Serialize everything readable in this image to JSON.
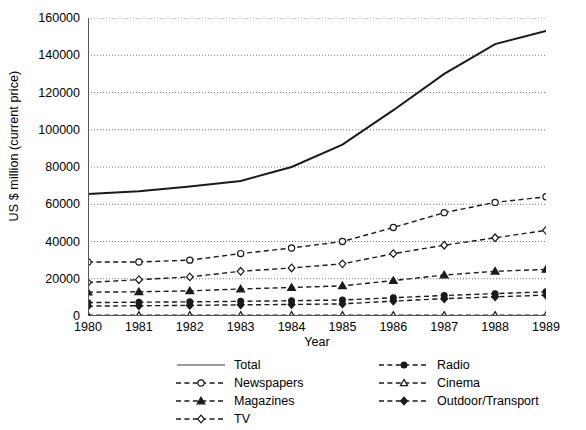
{
  "chart_data": {
    "type": "line",
    "title": "",
    "xlabel": "Year",
    "ylabel": "US $ million (current price)",
    "x": [
      1980,
      1981,
      1982,
      1983,
      1984,
      1985,
      1986,
      1987,
      1988,
      1989
    ],
    "xtick_labels": [
      "1980",
      "1981",
      "1982",
      "1983",
      "1984",
      "1985",
      "1986",
      "1987",
      "1988",
      "1989"
    ],
    "ytick_labels": [
      "0",
      "20000",
      "40000",
      "60000",
      "80000",
      "100000",
      "120000",
      "140000",
      "160000"
    ],
    "yticks": [
      0,
      20000,
      40000,
      60000,
      80000,
      100000,
      120000,
      140000,
      160000
    ],
    "ylim": [
      0,
      160000
    ],
    "xlim": [
      1980,
      1989
    ],
    "grid": "horizontal-dotted",
    "legend_position": "below-plot",
    "series": [
      {
        "name": "Total",
        "marker": "none",
        "line": "solid",
        "values": [
          65500,
          67000,
          69500,
          72500,
          80000,
          92000,
          110500,
          130000,
          146000,
          153000
        ]
      },
      {
        "name": "Newspapers",
        "marker": "open-circle",
        "line": "dashed",
        "values": [
          29000,
          29000,
          30000,
          33500,
          36500,
          40000,
          47500,
          55500,
          61000,
          64000
        ]
      },
      {
        "name": "Magazines",
        "marker": "filled-triangle",
        "line": "dashed",
        "values": [
          12800,
          13000,
          13500,
          14500,
          15300,
          16200,
          19000,
          22000,
          24000,
          25000
        ]
      },
      {
        "name": "TV",
        "marker": "open-diamond",
        "line": "dashed",
        "values": [
          18000,
          19500,
          21000,
          24000,
          25800,
          28000,
          33500,
          38000,
          42000,
          46000
        ]
      },
      {
        "name": "Radio",
        "marker": "filled-circle",
        "line": "dashed",
        "values": [
          7200,
          7400,
          7600,
          7900,
          8200,
          8600,
          9800,
          11000,
          12000,
          13000
        ]
      },
      {
        "name": "Cinema",
        "marker": "open-triangle",
        "line": "dashed",
        "values": [
          400,
          400,
          400,
          400,
          400,
          400,
          400,
          400,
          400,
          400
        ]
      },
      {
        "name": "Outdoor/Transport",
        "marker": "filled-diamond",
        "line": "dashed",
        "values": [
          5300,
          5500,
          5700,
          6000,
          6200,
          6500,
          8000,
          9300,
          10300,
          11200
        ]
      }
    ],
    "colors": {
      "line": "#1a1a1a",
      "grid": "#7a7a7a",
      "axis": "#555555",
      "background": "#ffffff"
    }
  },
  "legend": {
    "left_column": [
      "Total",
      "Newspapers",
      "Magazines",
      "TV"
    ],
    "right_column": [
      "Radio",
      "Cinema",
      "Outdoor/Transport"
    ]
  }
}
